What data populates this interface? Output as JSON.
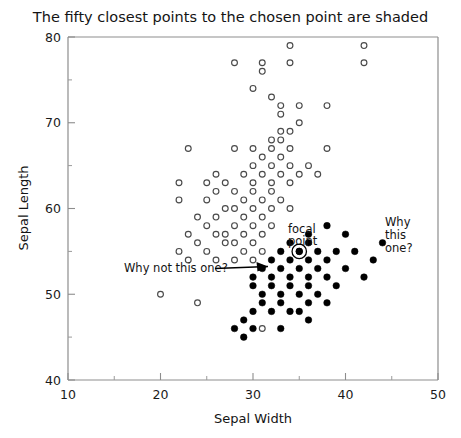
{
  "chart_data": {
    "type": "scatter",
    "title": "The fifty closest points to the chosen point are shaded",
    "xlabel": "Sepal Width",
    "ylabel": "Sepal Length",
    "xlim": [
      10,
      50
    ],
    "ylim": [
      40,
      80
    ],
    "xticks": [
      10,
      20,
      30,
      40,
      50
    ],
    "yticks": [
      40,
      50,
      60,
      70,
      80
    ],
    "xminorticks": [
      15,
      25,
      35,
      45
    ],
    "yminorticks": [
      45,
      55,
      65,
      75
    ],
    "grid": false,
    "legend": "none",
    "marker_legend": {
      "open_circle": "unshaded point (not among fifty closest)",
      "filled_circle": "shaded point (among the fifty closest)",
      "ringed_filled_circle": "focal point (the chosen point)"
    },
    "focal_point": {
      "x": 35,
      "y": 55
    },
    "series": [
      {
        "name": "unshaded",
        "marker": "open-circle",
        "points": [
          [
            34,
            79
          ],
          [
            42,
            77
          ],
          [
            34,
            77
          ],
          [
            28,
            77
          ],
          [
            31,
            77
          ],
          [
            42,
            79
          ],
          [
            31,
            76
          ],
          [
            30,
            74
          ],
          [
            32,
            73
          ],
          [
            33,
            72
          ],
          [
            35,
            72
          ],
          [
            38,
            72
          ],
          [
            33,
            71
          ],
          [
            35,
            70
          ],
          [
            34,
            69
          ],
          [
            33,
            69
          ],
          [
            32,
            68
          ],
          [
            33,
            68
          ],
          [
            30,
            67
          ],
          [
            32,
            67
          ],
          [
            34,
            67
          ],
          [
            38,
            67
          ],
          [
            28,
            67
          ],
          [
            23,
            67
          ],
          [
            31,
            66
          ],
          [
            33,
            66
          ],
          [
            30,
            65
          ],
          [
            32,
            65
          ],
          [
            34,
            65
          ],
          [
            36,
            65
          ],
          [
            26,
            64
          ],
          [
            29,
            64
          ],
          [
            31,
            64
          ],
          [
            33,
            64
          ],
          [
            35,
            64
          ],
          [
            37,
            64
          ],
          [
            22,
            63
          ],
          [
            27,
            63
          ],
          [
            30,
            63
          ],
          [
            32,
            63
          ],
          [
            34,
            63
          ],
          [
            25,
            63
          ],
          [
            28,
            62
          ],
          [
            30,
            62
          ],
          [
            32,
            62
          ],
          [
            26,
            62
          ],
          [
            29,
            61
          ],
          [
            31,
            61
          ],
          [
            33,
            61
          ],
          [
            22,
            61
          ],
          [
            25,
            61
          ],
          [
            28,
            60
          ],
          [
            30,
            60
          ],
          [
            32,
            60
          ],
          [
            34,
            60
          ],
          [
            27,
            60
          ],
          [
            24,
            59
          ],
          [
            29,
            59
          ],
          [
            31,
            59
          ],
          [
            26,
            59
          ],
          [
            28,
            58
          ],
          [
            30,
            58
          ],
          [
            32,
            58
          ],
          [
            25,
            58
          ],
          [
            27,
            57
          ],
          [
            29,
            57
          ],
          [
            31,
            57
          ],
          [
            23,
            57
          ],
          [
            26,
            57
          ],
          [
            28,
            56
          ],
          [
            30,
            56
          ],
          [
            24,
            56
          ],
          [
            27,
            56
          ],
          [
            29,
            55
          ],
          [
            31,
            55
          ],
          [
            25,
            55
          ],
          [
            22,
            55
          ],
          [
            28,
            54
          ],
          [
            30,
            54
          ],
          [
            26,
            54
          ],
          [
            23,
            54
          ],
          [
            20,
            50
          ],
          [
            24,
            49
          ],
          [
            31,
            46
          ]
        ]
      },
      {
        "name": "shaded",
        "marker": "filled-circle",
        "points": [
          [
            38,
            58
          ],
          [
            40,
            57
          ],
          [
            36,
            57
          ],
          [
            44,
            56
          ],
          [
            34,
            56
          ],
          [
            36,
            56
          ],
          [
            41,
            55
          ],
          [
            33,
            55
          ],
          [
            35,
            55
          ],
          [
            37,
            55
          ],
          [
            39,
            55
          ],
          [
            43,
            54
          ],
          [
            32,
            54
          ],
          [
            34,
            54
          ],
          [
            36,
            54
          ],
          [
            38,
            54
          ],
          [
            31,
            53
          ],
          [
            33,
            53
          ],
          [
            35,
            53
          ],
          [
            37,
            53
          ],
          [
            40,
            53
          ],
          [
            30,
            52
          ],
          [
            32,
            52
          ],
          [
            34,
            52
          ],
          [
            36,
            52
          ],
          [
            38,
            52
          ],
          [
            30,
            51
          ],
          [
            32,
            51
          ],
          [
            34,
            51
          ],
          [
            36,
            51
          ],
          [
            33,
            50
          ],
          [
            35,
            50
          ],
          [
            31,
            49
          ],
          [
            33,
            49
          ],
          [
            36,
            49
          ],
          [
            38,
            49
          ],
          [
            30,
            48
          ],
          [
            32,
            48
          ],
          [
            35,
            48
          ],
          [
            28,
            46
          ],
          [
            30,
            46
          ],
          [
            33,
            46
          ],
          [
            29,
            45
          ],
          [
            39,
            51
          ],
          [
            42,
            52
          ],
          [
            37,
            50
          ],
          [
            34,
            48
          ],
          [
            31,
            50
          ],
          [
            29,
            47
          ],
          [
            36,
            47
          ]
        ]
      }
    ],
    "annotations": [
      {
        "name": "focal-point-label",
        "text_lines": [
          "focal",
          "point"
        ],
        "x": 35,
        "y": 55,
        "style": "label-above-marker"
      },
      {
        "name": "why-not-this-one-annotation",
        "text": "Why not this one?",
        "arrow_target": {
          "x": 32.8,
          "y": 52.9
        },
        "style": "arrow-right"
      },
      {
        "name": "why-this-one-annotation",
        "text_lines": [
          "Why",
          "this",
          "one?"
        ],
        "x": 44,
        "y": 56,
        "style": "label-right-of-marker"
      }
    ]
  },
  "figure": {
    "title": "The fifty closest points to the chosen point are shaded",
    "xlabel": "Sepal Width",
    "ylabel": "Sepal Length",
    "xtick_labels": [
      "10",
      "20",
      "30",
      "40",
      "50"
    ],
    "ytick_labels": [
      "40",
      "50",
      "60",
      "70",
      "80"
    ],
    "annotations": {
      "focal_line1": "focal",
      "focal_line2": "point",
      "why_not": "Why not this one?",
      "why_this_1": "Why",
      "why_this_2": "this",
      "why_this_3": "one?"
    },
    "colors": {
      "background": "#ffffff",
      "frame": "#8d8d8d",
      "open_marker_stroke": "#4a4a4a",
      "filled_marker": "#000000",
      "text": "#141414"
    }
  }
}
